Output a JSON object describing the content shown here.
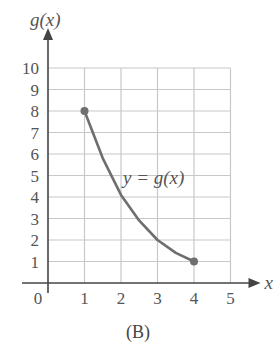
{
  "chart_data": {
    "type": "line",
    "title": "",
    "caption": "(B)",
    "xlabel": "x",
    "ylabel": "g(x)",
    "curve_label": "y = g(x)",
    "xlim": [
      0,
      5
    ],
    "ylim": [
      0,
      10
    ],
    "grid": true,
    "x_ticks": [
      "0",
      "1",
      "2",
      "3",
      "4",
      "5"
    ],
    "y_ticks": [
      "1",
      "2",
      "3",
      "4",
      "5",
      "6",
      "7",
      "8",
      "9",
      "10"
    ],
    "series": [
      {
        "name": "y = g(x)",
        "x": [
          1,
          1.5,
          2,
          2.5,
          3,
          3.5,
          4
        ],
        "y": [
          8,
          5.8,
          4.1,
          2.9,
          2.0,
          1.4,
          1.0
        ],
        "endpoints": [
          [
            1,
            8
          ],
          [
            4,
            1
          ]
        ]
      }
    ]
  },
  "colors": {
    "curve": "#6e6e6e",
    "grid": "#c8c8c8",
    "axis": "#444444"
  }
}
